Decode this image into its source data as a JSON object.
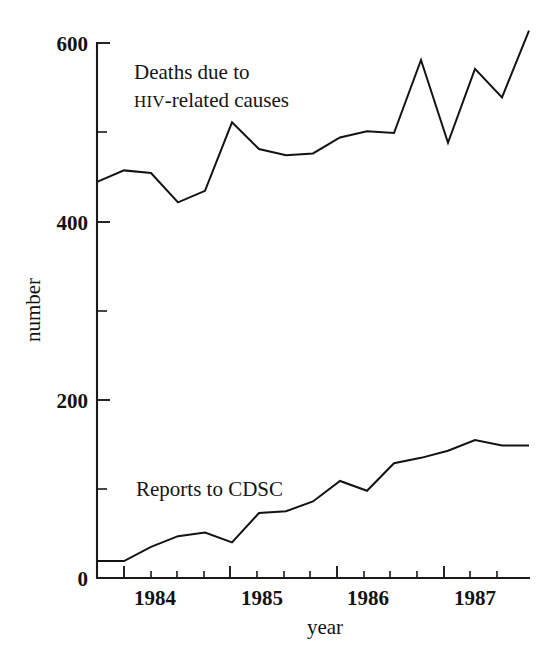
{
  "chart_data": {
    "type": "line",
    "title": "",
    "subtitle": "",
    "xlabel": "year",
    "ylabel": "number",
    "xlim": [
      1983.75,
      1987.75
    ],
    "ylim": [
      0,
      630
    ],
    "grid": false,
    "legend_position": "inline-annotations",
    "x_tick_labels": [
      "1984",
      "1985",
      "1986",
      "1987"
    ],
    "x_major_ticks": [
      1984,
      1985,
      1986,
      1987
    ],
    "x_minor_tick_interval_years": 0.25,
    "y_tick_labels": [
      "0",
      "200",
      "400",
      "600"
    ],
    "y_major_ticks": [
      0,
      200,
      400,
      600
    ],
    "y_minor_ticks": [
      100,
      300,
      500
    ],
    "x_unit": "quarter",
    "x": [
      1983.75,
      1984.0,
      1984.25,
      1984.5,
      1984.75,
      1985.0,
      1985.25,
      1985.5,
      1985.75,
      1986.0,
      1986.25,
      1986.5,
      1986.75,
      1987.0,
      1987.25,
      1987.5,
      1987.75
    ],
    "series": [
      {
        "name": "Deaths due to HIV-related causes",
        "label_line1": "Deaths due to",
        "label_line2_smallcaps": "HIV",
        "label_line2_rest": "-related causes",
        "color": "#131313",
        "values": [
          445,
          458,
          455,
          422,
          435,
          512,
          482,
          475,
          477,
          495,
          502,
          500,
          582,
          489,
          572,
          540,
          615
        ]
      },
      {
        "name": "Reports to CDSC",
        "label_line1": "Reports to CDSC",
        "color": "#131313",
        "values": [
          19,
          19,
          35,
          47,
          51,
          40,
          73,
          75,
          86,
          109,
          98,
          129,
          135,
          143,
          155,
          149,
          149
        ]
      }
    ],
    "annotations": [
      {
        "id": "deaths-label",
        "text": "Deaths due to HIV-related causes",
        "x_px": 134,
        "y_px": 72
      },
      {
        "id": "reports-label",
        "text": "Reports to CDSC",
        "x_px": 136,
        "y_px": 489
      }
    ]
  },
  "axes": {
    "y_labels": [
      {
        "text": "600",
        "y_px": 43
      },
      {
        "text": "400",
        "y_px": 222
      },
      {
        "text": "200",
        "y_px": 400
      },
      {
        "text": "0",
        "y_px": 578
      }
    ],
    "x_labels": [
      {
        "text": "1984",
        "x_px": 155
      },
      {
        "text": "1985",
        "x_px": 262
      },
      {
        "text": "1986",
        "x_px": 368
      },
      {
        "text": "1987",
        "x_px": 475
      }
    ],
    "y_axis_title": "number",
    "x_axis_title": "year"
  },
  "labels": {
    "deaths_line1": "Deaths due to",
    "deaths_hiv": "HIV",
    "deaths_line2_rest": "-related causes",
    "reports": "Reports to CDSC",
    "y600": "600",
    "y400": "400",
    "y200": "200",
    "y0": "0",
    "x1984": "1984",
    "x1985": "1985",
    "x1986": "1986",
    "x1987": "1987",
    "ylabel": "number",
    "xlabel": "year"
  }
}
